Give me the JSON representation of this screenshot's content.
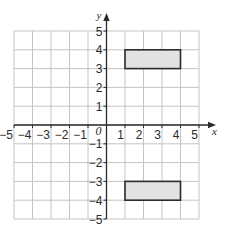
{
  "diagram": {
    "type": "coordinate-grid",
    "x_axis": {
      "label": "x",
      "min": -5,
      "max": 5,
      "tick_labels": [
        "-5",
        "-4",
        "-3",
        "-2",
        "-1",
        "1",
        "2",
        "3",
        "4",
        "5"
      ]
    },
    "y_axis": {
      "label": "y",
      "min": -5,
      "max": 5,
      "tick_labels": [
        "5",
        "4",
        "3",
        "2",
        "1",
        "-1",
        "-2",
        "-3",
        "-4",
        "-5"
      ]
    },
    "origin_label": "0",
    "shapes": [
      {
        "name": "upper-rectangle",
        "x1": 1,
        "y1": 3,
        "x2": 4,
        "y2": 4,
        "fill": "#e2e2e2",
        "stroke": "#2b2b2b"
      },
      {
        "name": "lower-rectangle",
        "x1": 1,
        "y1": -4,
        "x2": 4,
        "y2": -3,
        "fill": "#e2e2e2",
        "stroke": "#2b2b2b"
      }
    ],
    "colors": {
      "grid": "#c4c4c4",
      "axis": "#2b2b2b",
      "background": "#ffffff"
    }
  }
}
